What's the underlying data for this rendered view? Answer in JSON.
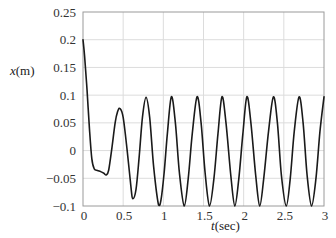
{
  "chart_data": {
    "type": "line",
    "title": "",
    "xlabel": "t(sec)",
    "xlabel_var": "t",
    "xlabel_unit": "(sec)",
    "ylabel": "x(m)",
    "ylabel_var": "x",
    "ylabel_unit": "(m)",
    "xlim": [
      0,
      3
    ],
    "ylim": [
      -0.1,
      0.25
    ],
    "grid": true,
    "legend": null,
    "xticks": [
      0,
      0.5,
      1,
      1.5,
      2,
      2.5,
      3
    ],
    "xtick_labels": [
      "0",
      "0.5",
      "1",
      "1.5",
      "2",
      "2.5",
      "3"
    ],
    "yticks": [
      0.25,
      0.2,
      0.15,
      0.1,
      0.05,
      0,
      -0.05,
      -0.1
    ],
    "ytick_labels": [
      "0.25",
      "0.2",
      "0.15",
      "0.1",
      "0.05",
      "0",
      "−0.05",
      "−0.1"
    ],
    "series": [
      {
        "name": "x(t)",
        "color": "#1a1a1a",
        "x": [
          0,
          0.02,
          0.05,
          0.08,
          0.11,
          0.14,
          0.18,
          0.22,
          0.26,
          0.29,
          0.32,
          0.36,
          0.4,
          0.43,
          0.46,
          0.5,
          0.55,
          0.6,
          0.62,
          0.66,
          0.7,
          0.74,
          0.785,
          0.83,
          0.88,
          0.94,
          0.97,
          1.01,
          1.05,
          1.1,
          1.15,
          1.2,
          1.26,
          1.31,
          1.36,
          1.42,
          1.47,
          1.52,
          1.575,
          1.63,
          1.68,
          1.73,
          1.78,
          1.84,
          1.89,
          1.94,
          1.99,
          2.04,
          2.09,
          2.15,
          2.2,
          2.25,
          2.31,
          2.37,
          2.42,
          2.47,
          2.53,
          2.58,
          2.63,
          2.69,
          2.74,
          2.79,
          2.845,
          2.9,
          2.95,
          3.0
        ],
        "y": [
          0.2,
          0.17,
          0.11,
          0.04,
          -0.015,
          -0.033,
          -0.036,
          -0.038,
          -0.041,
          -0.044,
          -0.035,
          0.005,
          0.05,
          0.07,
          0.076,
          0.06,
          0.0,
          -0.07,
          -0.087,
          -0.07,
          -0.01,
          0.06,
          0.096,
          0.06,
          -0.03,
          -0.098,
          -0.09,
          -0.04,
          0.03,
          0.097,
          0.05,
          -0.04,
          -0.1,
          -0.05,
          0.03,
          0.097,
          0.05,
          -0.04,
          -0.1,
          -0.05,
          0.03,
          0.097,
          0.05,
          -0.045,
          -0.1,
          -0.05,
          0.03,
          0.097,
          0.05,
          -0.045,
          -0.1,
          -0.05,
          0.035,
          0.097,
          0.05,
          -0.045,
          -0.1,
          -0.05,
          0.035,
          0.097,
          0.05,
          -0.045,
          -0.1,
          -0.05,
          0.035,
          0.097
        ],
        "description": "Initial value 0.2 m, fast decay to ~-0.04 m with a shoulder near t=0.15-0.3 s, then oscillation growing to steady amplitude ~0.1 m with period ~0.317 s; peaks near t=0.46, 0.785, 1.10, 1.42, 1.73, 2.04, 2.37, 2.69, 3.0 s; troughs near t=0.61, 0.94, 1.26, 1.575, 1.89, 2.20, 2.53, 2.845 s"
      }
    ]
  },
  "colors": {
    "grid": "#dcdcdc",
    "axes": "#9a9a9a",
    "line": "#1a1a1a",
    "text": "#333333"
  }
}
